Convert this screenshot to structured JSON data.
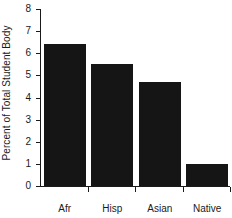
{
  "chart_data": {
    "type": "bar",
    "title": "",
    "xlabel": "",
    "ylabel": "Percent of Total Student Body",
    "categories": [
      "Afr",
      "Hisp",
      "Asian",
      "Native"
    ],
    "values": [
      6.4,
      5.5,
      4.7,
      1.0
    ],
    "ylim": [
      0,
      8
    ],
    "ytick_labels": [
      "0",
      "1",
      "2",
      "3",
      "4",
      "5",
      "6",
      "7",
      "8"
    ],
    "ytick_values": [
      0,
      1,
      2,
      3,
      4,
      5,
      6,
      7,
      8
    ],
    "grid": false,
    "legend": false,
    "bar_color": "#151515",
    "axis_color": "#1a1a1a",
    "background": "#ffffff"
  }
}
